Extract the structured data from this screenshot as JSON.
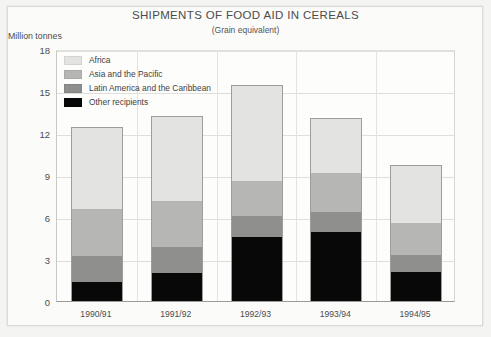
{
  "frame": {
    "background": "#fbfbfa",
    "border_color": "#d9d9d6"
  },
  "header": {
    "title": "SHIPMENTS OF FOOD AID IN CEREALS",
    "subtitle": "(Grain equivalent)",
    "y_axis_caption": "Million tonnes"
  },
  "legend": {
    "items": [
      {
        "label": "Africa",
        "color": "#e3e3e2"
      },
      {
        "label": "Asia and the Pacific",
        "color": "#b6b6b5"
      },
      {
        "label": "Latin America and the Caribbean",
        "color": "#8f8f8e"
      },
      {
        "label": "Other recipients",
        "color": "#080808"
      }
    ]
  },
  "chart_data": {
    "type": "bar",
    "stacked": true,
    "title": "SHIPMENTS OF FOOD AID IN CEREALS",
    "subtitle": "(Grain equivalent)",
    "xlabel": "",
    "ylabel": "Million tonnes",
    "ylim": [
      0,
      18
    ],
    "yticks": [
      0,
      3,
      6,
      9,
      12,
      15,
      18
    ],
    "grid": true,
    "legend_position": "top-left-inside",
    "categories": [
      "1990/91",
      "1991/92",
      "1992/93",
      "1993/94",
      "1994/95"
    ],
    "series": [
      {
        "name": "Other recipients",
        "color": "#080808",
        "values": [
          1.4,
          2.0,
          4.6,
          4.95,
          2.1
        ]
      },
      {
        "name": "Latin America and the Caribbean",
        "color": "#8f8f8e",
        "values": [
          1.8,
          1.9,
          1.5,
          1.45,
          1.2
        ]
      },
      {
        "name": "Asia and the Pacific",
        "color": "#b6b6b5",
        "values": [
          3.4,
          3.3,
          2.5,
          2.8,
          2.3
        ]
      },
      {
        "name": "Africa",
        "color": "#e3e3e2",
        "values": [
          5.8,
          6.0,
          6.8,
          3.9,
          4.1
        ]
      }
    ],
    "totals": [
      12.4,
      13.2,
      15.4,
      13.1,
      9.7
    ]
  }
}
